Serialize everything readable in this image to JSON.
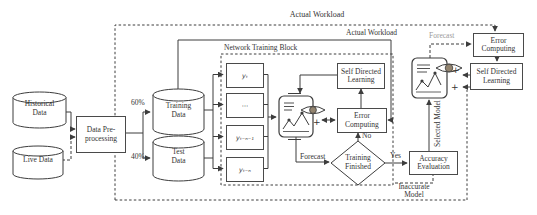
{
  "diagram": {
    "outer_loop_label": "Actual Workload",
    "inner_loop_label": "Actual Workload",
    "forecast_top_label": "Forecast",
    "forecast_mid_label": "Forecast",
    "ntb_label": "Network Training Block",
    "split_60": "60%",
    "split_40": "40%",
    "no_label": "No",
    "yes_label": "Yes",
    "selected_model_label": "Selected Model",
    "inaccurate_line1": "Inaccurate",
    "inaccurate_line2": "Model",
    "plus_mid": "+",
    "plus_top_1": "+",
    "plus_top_2": "+"
  },
  "stores": {
    "historical": {
      "l1": "Historical",
      "l2": "Data"
    },
    "live": {
      "l1": "Live Data"
    },
    "training": {
      "l1": "Training",
      "l2": "Data"
    },
    "test": {
      "l1": "Test",
      "l2": "Data"
    }
  },
  "nodes": {
    "preprocess": {
      "l1": "Data Pre-",
      "l2": "processing"
    },
    "sdl_mid": {
      "l1": "Self Directed",
      "l2": "Learning"
    },
    "ec_mid": {
      "l1": "Error",
      "l2": "Computing"
    },
    "decision": {
      "l1": "Training",
      "l2": "Finished"
    },
    "accuracy": {
      "l1": "Accuracy",
      "l2": "Evaluation"
    },
    "ec_top": {
      "l1": "Error",
      "l2": "Computing"
    },
    "sdl_top": {
      "l1": "Self Directed",
      "l2": "Learning"
    }
  },
  "inputs": {
    "i1": "yₜ",
    "i2": "⋯",
    "i3": "yₜ₋ₙ₋₁",
    "i4": "yₜ₋ₙ"
  },
  "colors": {
    "line": "#3d3d3d",
    "text": "#343434",
    "muted": "#9a9a9a",
    "iris": "#93846f"
  }
}
